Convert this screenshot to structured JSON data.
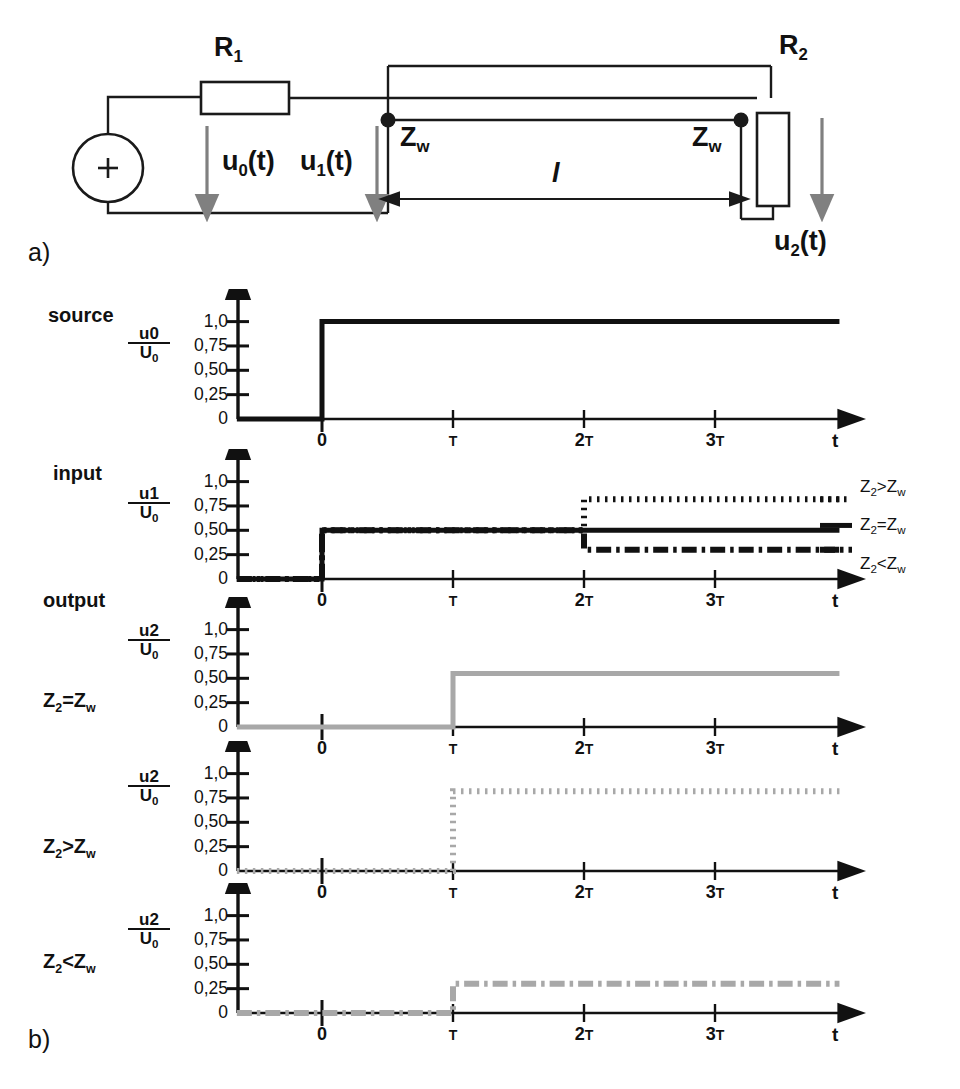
{
  "figure": {
    "panel_a_letter": "a)",
    "panel_b_letter": "b)"
  },
  "circuit": {
    "r1_label": "R",
    "r1_sub": "1",
    "r2_label": "R",
    "r2_sub": "2",
    "source_polarity": "+",
    "u0_label": "u",
    "u0_sub": "0",
    "u0_suffix": "(t)",
    "u1_label": "u",
    "u1_sub": "1",
    "u1_suffix": "(t)",
    "u2_label": "u",
    "u2_sub": "2",
    "u2_suffix": "(t)",
    "zw_left": "Z",
    "zw_left_sub": "w",
    "zw_right": "Z",
    "zw_right_sub": "w",
    "length_label": "l",
    "line_color": "#1a1a1a",
    "arrow_color": "#808080"
  },
  "axes_common": {
    "y_ticks": [
      "1,0",
      "0,75",
      "0,50",
      "0,25",
      "0"
    ],
    "y_values": [
      1.0,
      0.75,
      0.5,
      0.25,
      0
    ],
    "x_ticks": [
      "0",
      "T",
      "2T",
      "3T"
    ],
    "x_values": [
      0,
      1,
      2,
      3
    ],
    "x_axis_name": "t",
    "ylim": [
      0,
      1.15
    ],
    "xlim": [
      -0.65,
      3.95
    ],
    "grid": false
  },
  "legend": {
    "position": "right-of-input-plot",
    "entries": [
      {
        "label_z": "Z",
        "label_sub": "2",
        "label_rel": ">Z",
        "label_sub2": "w",
        "style": "dotted"
      },
      {
        "label_z": "Z",
        "label_sub": "2",
        "label_rel": "=Z",
        "label_sub2": "w",
        "style": "solid"
      },
      {
        "label_z": "Z",
        "label_sub": "2",
        "label_rel": "<Z",
        "label_sub2": "w",
        "style": "dashdot"
      }
    ]
  },
  "rows": [
    {
      "id": "source",
      "title": "source",
      "condition": "",
      "frac_num": "u0",
      "frac_den": "U",
      "frac_den_sub": "0"
    },
    {
      "id": "input",
      "title": "input",
      "condition": "",
      "frac_num": "u1",
      "frac_den": "U",
      "frac_den_sub": "0"
    },
    {
      "id": "output-matched",
      "title": "output",
      "condition_z": "Z",
      "condition_sub": "2",
      "condition_rel": "=Z",
      "condition_sub2": "w",
      "frac_num": "u2",
      "frac_den": "U",
      "frac_den_sub": "0"
    },
    {
      "id": "output-high",
      "title": "",
      "condition_z": "Z",
      "condition_sub": "2",
      "condition_rel": ">Z",
      "condition_sub2": "w",
      "frac_num": "u2",
      "frac_den": "U",
      "frac_den_sub": "0"
    },
    {
      "id": "output-low",
      "title": "",
      "condition_z": "Z",
      "condition_sub": "2",
      "condition_rel": "<Z",
      "condition_sub2": "w",
      "frac_num": "u2",
      "frac_den": "U",
      "frac_den_sub": "0"
    }
  ],
  "chart_data": [
    {
      "type": "line",
      "id": "source",
      "title": "source",
      "xlabel": "t",
      "ylabel": "u0/U0",
      "xlim": [
        -0.65,
        3.95
      ],
      "ylim": [
        0,
        1.15
      ],
      "xticks": [
        0,
        1,
        2,
        3
      ],
      "xticklabels": [
        "0",
        "T",
        "2T",
        "3T"
      ],
      "yticks": [
        0,
        0.25,
        0.5,
        0.75,
        1.0
      ],
      "yticklabels": [
        "0",
        "0,25",
        "0,50",
        "0,75",
        "1,0"
      ],
      "grid": false,
      "series": [
        {
          "name": "u0/U0",
          "style": "solid",
          "color": "#111111",
          "points": [
            [
              -0.65,
              0
            ],
            [
              0,
              0
            ],
            [
              0,
              1.0
            ],
            [
              3.95,
              1.0
            ]
          ]
        }
      ]
    },
    {
      "type": "line",
      "id": "input",
      "title": "input",
      "xlabel": "t",
      "ylabel": "u1/U0",
      "xlim": [
        -0.65,
        3.95
      ],
      "ylim": [
        0,
        1.15
      ],
      "xticks": [
        0,
        1,
        2,
        3
      ],
      "xticklabels": [
        "0",
        "T",
        "2T",
        "3T"
      ],
      "yticks": [
        0,
        0.25,
        0.5,
        0.75,
        1.0
      ],
      "yticklabels": [
        "0",
        "0,25",
        "0,50",
        "0,75",
        "1,0"
      ],
      "grid": false,
      "series": [
        {
          "name": "Z2>Zw",
          "style": "dotted",
          "color": "#111111",
          "points": [
            [
              -0.65,
              0
            ],
            [
              0,
              0
            ],
            [
              0,
              0.5
            ],
            [
              2,
              0.5
            ],
            [
              2,
              0.82
            ],
            [
              3.95,
              0.82
            ]
          ]
        },
        {
          "name": "Z2=Zw",
          "style": "solid",
          "color": "#111111",
          "points": [
            [
              -0.65,
              0
            ],
            [
              0,
              0
            ],
            [
              0,
              0.5
            ],
            [
              3.95,
              0.5
            ]
          ]
        },
        {
          "name": "Z2<Zw",
          "style": "dashdot",
          "color": "#111111",
          "points": [
            [
              -0.65,
              0
            ],
            [
              0,
              0
            ],
            [
              0,
              0.5
            ],
            [
              2,
              0.5
            ],
            [
              2,
              0.3
            ],
            [
              3.95,
              0.3
            ]
          ]
        }
      ]
    },
    {
      "type": "line",
      "id": "output-matched",
      "title": "output, Z2=Zw",
      "xlabel": "t",
      "ylabel": "u2/U0",
      "xlim": [
        -0.65,
        3.95
      ],
      "ylim": [
        0,
        1.15
      ],
      "xticks": [
        0,
        1,
        2,
        3
      ],
      "xticklabels": [
        "0",
        "T",
        "2T",
        "3T"
      ],
      "yticks": [
        0,
        0.25,
        0.5,
        0.75,
        1.0
      ],
      "yticklabels": [
        "0",
        "0,25",
        "0,50",
        "0,75",
        "1,0"
      ],
      "grid": false,
      "series": [
        {
          "name": "u2/U0 (Z2=Zw)",
          "style": "solid",
          "color": "#a8a8a8",
          "points": [
            [
              -0.65,
              0
            ],
            [
              1,
              0
            ],
            [
              1,
              0.55
            ],
            [
              3.95,
              0.55
            ]
          ]
        }
      ]
    },
    {
      "type": "line",
      "id": "output-high",
      "title": "Z2>Zw",
      "xlabel": "t",
      "ylabel": "u2/U0",
      "xlim": [
        -0.65,
        3.95
      ],
      "ylim": [
        0,
        1.15
      ],
      "xticks": [
        0,
        1,
        2,
        3
      ],
      "xticklabels": [
        "0",
        "T",
        "2T",
        "3T"
      ],
      "yticks": [
        0,
        0.25,
        0.5,
        0.75,
        1.0
      ],
      "yticklabels": [
        "0",
        "0,25",
        "0,50",
        "0,75",
        "1,0"
      ],
      "grid": false,
      "series": [
        {
          "name": "u2/U0 (Z2>Zw)",
          "style": "dotted",
          "color": "#a8a8a8",
          "points": [
            [
              -0.65,
              0
            ],
            [
              1,
              0
            ],
            [
              1,
              0.82
            ],
            [
              3.95,
              0.82
            ]
          ]
        }
      ]
    },
    {
      "type": "line",
      "id": "output-low",
      "title": "Z2<Zw",
      "xlabel": "t",
      "ylabel": "u2/U0",
      "xlim": [
        -0.65,
        3.95
      ],
      "ylim": [
        0,
        1.15
      ],
      "xticks": [
        0,
        1,
        2,
        3
      ],
      "xticklabels": [
        "0",
        "T",
        "2T",
        "3T"
      ],
      "yticks": [
        0,
        0.25,
        0.5,
        0.75,
        1.0
      ],
      "yticklabels": [
        "0",
        "0,25",
        "0,50",
        "0,75",
        "1,0"
      ],
      "grid": false,
      "series": [
        {
          "name": "u2/U0 (Z2<Zw)",
          "style": "dashdot",
          "color": "#a8a8a8",
          "points": [
            [
              -0.65,
              0
            ],
            [
              1,
              0
            ],
            [
              1,
              0.3
            ],
            [
              3.95,
              0.3
            ]
          ]
        }
      ]
    }
  ]
}
